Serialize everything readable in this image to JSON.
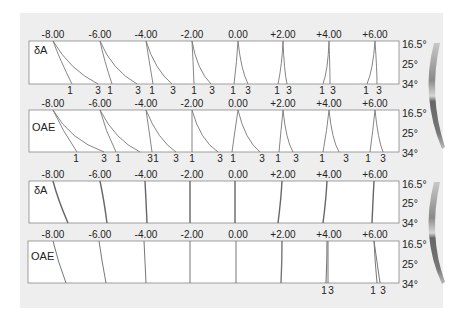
{
  "figure": {
    "columns": [
      "-8.00",
      "-6.00",
      "-4.00",
      "-2.00",
      "0.00",
      "+2.00",
      "+4.00",
      "+6.00"
    ],
    "angles": [
      "16.5°",
      "25°",
      "34°"
    ],
    "panels": [
      {
        "label": "δA",
        "bottom_marks": [
          [
            "1",
            "3"
          ],
          [
            "1",
            "3"
          ],
          [
            "1",
            "3"
          ],
          [
            "1",
            "3"
          ],
          [
            "1",
            "3"
          ],
          [
            "1",
            "3"
          ],
          [
            "1",
            "3"
          ],
          [
            "1",
            "3"
          ]
        ]
      },
      {
        "label": "OAE",
        "bottom_marks": [
          [
            "1",
            "3"
          ],
          [
            "1",
            "3"
          ],
          [
            "1",
            "3"
          ],
          [
            "1",
            "3"
          ],
          [
            "1",
            "3"
          ],
          [
            "1",
            "3"
          ],
          [
            "1",
            "3"
          ],
          [
            "1",
            "3"
          ]
        ]
      },
      {
        "label": "δA",
        "bottom_marks": []
      },
      {
        "label": "OAE",
        "bottom_marks": [
          [
            "1",
            "3"
          ],
          [
            "1",
            "3"
          ]
        ]
      }
    ],
    "colors": {
      "background": "#eeeeee",
      "panel_fill": "#ffffff",
      "border": "#888888",
      "curve": "#666666",
      "gradient_dark": "#555555",
      "gradient_light": "#dddddd"
    }
  }
}
